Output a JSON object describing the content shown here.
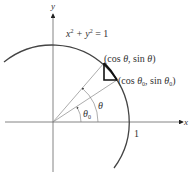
{
  "diagram": {
    "axes": {
      "x_label": "x",
      "y_label": "y"
    },
    "circle_equation": {
      "base": "x",
      "exp1": "2",
      "plus": " + y",
      "exp2": "2",
      "eq": " = 1"
    },
    "radius_label": "1",
    "point_theta": {
      "text_pre": "(cos ",
      "sym": "θ",
      "mid": ", sin ",
      "sym2": "θ",
      "post": ")"
    },
    "point_theta0": {
      "text_pre": "(cos ",
      "sym": "θ",
      "sub": "0",
      "mid": ", sin ",
      "sym2": "θ",
      "sub2": "0",
      "post": ")"
    },
    "angle_theta": {
      "sym": "θ"
    },
    "angle_theta0": {
      "sym": "θ",
      "sub": "0"
    },
    "colors": {
      "axis": "#555555",
      "arc": "#444444",
      "ray": "#888888",
      "triangle": "#111111"
    }
  }
}
